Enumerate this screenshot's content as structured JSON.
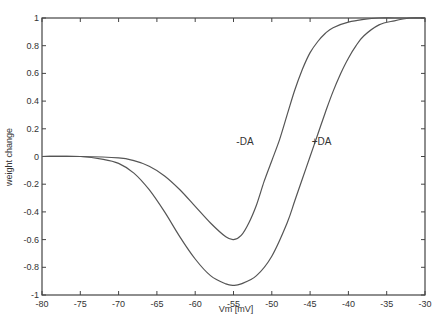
{
  "chart_data": {
    "type": "line",
    "title": "",
    "xlabel": "Vm [mV]",
    "ylabel": "weight change",
    "xlim": [
      -80,
      -30
    ],
    "ylim": [
      -1,
      1
    ],
    "xticks": [
      -80,
      -75,
      -70,
      -65,
      -60,
      -55,
      -50,
      -45,
      -40,
      -35,
      -30
    ],
    "xtick_labels": [
      "-80",
      "-75",
      "-70",
      "-65",
      "-60",
      "-55",
      "-50",
      "-45",
      "-40",
      "-35",
      "-30"
    ],
    "yticks": [
      -1,
      -0.8,
      -0.6,
      -0.4,
      -0.2,
      0,
      0.2,
      0.4,
      0.6,
      0.8,
      1
    ],
    "ytick_labels": [
      "-1",
      "-0.8",
      "-0.6",
      "-0.4",
      "-0.2",
      "0",
      "0.2",
      "0.4",
      "0.6",
      "0.8",
      "1"
    ],
    "grid": false,
    "legend": "none",
    "series": [
      {
        "name": "-DA",
        "x": [
          -80,
          -75,
          -70,
          -68,
          -66,
          -64,
          -62,
          -60,
          -58,
          -56,
          -55,
          -54,
          -53,
          -52,
          -51,
          -50,
          -49,
          -48,
          -47,
          -46,
          -45,
          -44,
          -43,
          -42,
          -40,
          -38,
          -36,
          -34,
          -32,
          -30
        ],
        "y": [
          0,
          0,
          -0.01,
          -0.03,
          -0.07,
          -0.14,
          -0.24,
          -0.36,
          -0.48,
          -0.58,
          -0.6,
          -0.57,
          -0.48,
          -0.35,
          -0.18,
          -0.03,
          0.12,
          0.3,
          0.48,
          0.63,
          0.75,
          0.83,
          0.89,
          0.93,
          0.97,
          0.99,
          1.0,
          1.0,
          1.0,
          1.0
        ]
      },
      {
        "name": "+DA",
        "x": [
          -80,
          -75,
          -72,
          -70,
          -68,
          -66,
          -64,
          -62,
          -60,
          -58,
          -56,
          -55,
          -54,
          -52,
          -50,
          -48,
          -47,
          -46,
          -45,
          -44,
          -43,
          -42,
          -41,
          -40,
          -39,
          -38,
          -36,
          -34,
          -32,
          -30
        ],
        "y": [
          0,
          0,
          -0.02,
          -0.05,
          -0.12,
          -0.24,
          -0.4,
          -0.58,
          -0.74,
          -0.86,
          -0.92,
          -0.93,
          -0.92,
          -0.86,
          -0.72,
          -0.48,
          -0.32,
          -0.16,
          0.0,
          0.16,
          0.32,
          0.47,
          0.6,
          0.71,
          0.8,
          0.87,
          0.95,
          0.98,
          1.0,
          1.0
        ]
      }
    ],
    "annotations": [
      {
        "text": "-DA",
        "x": -53.5,
        "y": 0.08
      },
      {
        "text": "+DA",
        "x": -43.5,
        "y": 0.08
      }
    ]
  }
}
